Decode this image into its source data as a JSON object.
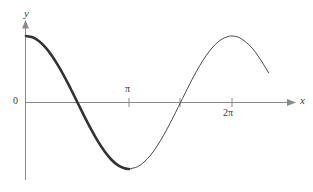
{
  "figure": {
    "background_color": "#ffffff",
    "width": 313,
    "height": 192
  },
  "axes": {
    "x_axis_label": "x",
    "y_axis_label": "y",
    "origin_label": "0",
    "axis_color": "#8a8a8a",
    "label_color": "#3a3a3a"
  },
  "ticks": {
    "x": [
      {
        "label": "π",
        "position": "above-axis",
        "value": 3.1416
      },
      {
        "label": "2π",
        "position": "below-axis",
        "value": 6.2832
      }
    ]
  },
  "chart_data": {
    "type": "line",
    "title": "",
    "xlabel": "x",
    "ylabel": "y",
    "grid": false,
    "legend": null,
    "xlim": [
      0,
      7.6
    ],
    "ylim": [
      -1.15,
      1.25
    ],
    "xticks": [
      3.1416,
      6.2832
    ],
    "xticklabels": [
      "π",
      "2π"
    ],
    "yticks": [
      0
    ],
    "yticklabels": [
      "0"
    ],
    "series": [
      {
        "name": "y = cos(x) emphasized branch",
        "style": "thick",
        "color": "#333333",
        "linewidth": 2.6,
        "x": [
          0.0,
          0.2,
          0.4,
          0.6,
          0.8,
          1.0,
          1.2,
          1.4,
          1.5708,
          1.8,
          2.0,
          2.2,
          2.4,
          2.6,
          2.8,
          3.0,
          3.1416
        ],
        "y": [
          1.0,
          0.98,
          0.921,
          0.825,
          0.697,
          0.54,
          0.362,
          0.17,
          0.0,
          -0.227,
          -0.416,
          -0.589,
          -0.737,
          -0.857,
          -0.942,
          -0.99,
          -1.0
        ]
      },
      {
        "name": "y = cos(x) remaining branch",
        "style": "thin",
        "color": "#4a4a4a",
        "linewidth": 1.0,
        "x": [
          3.1416,
          3.4,
          3.6,
          3.8,
          4.0,
          4.2,
          4.4,
          4.6,
          4.7124,
          5.0,
          5.2,
          5.4,
          5.6,
          5.8,
          6.0,
          6.2,
          6.2832,
          6.5,
          6.8,
          7.0,
          7.2,
          7.4
        ],
        "y": [
          -1.0,
          -0.966,
          -0.896,
          -0.791,
          -0.654,
          -0.49,
          -0.307,
          -0.112,
          0.0,
          0.284,
          0.469,
          0.635,
          0.776,
          0.886,
          0.96,
          0.997,
          1.0,
          0.977,
          0.869,
          0.754,
          0.609,
          0.446
        ]
      }
    ],
    "annotations": [
      {
        "text": "zero crossing",
        "x": 1.5708,
        "y": 0.0
      },
      {
        "text": "minimum",
        "x": 3.1416,
        "y": -1.0
      },
      {
        "text": "zero crossing",
        "x": 4.7124,
        "y": 0.0
      }
    ]
  }
}
